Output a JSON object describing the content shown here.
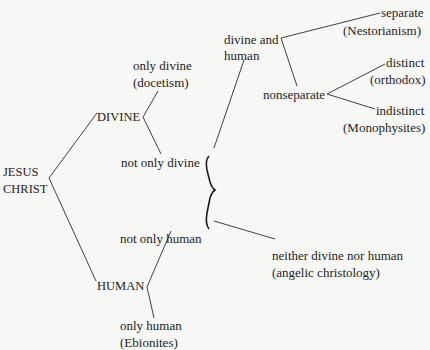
{
  "diagram": {
    "type": "tree",
    "root": {
      "line1": "JESUS",
      "line2": "CHRIST"
    },
    "divine": {
      "label": "DIVINE",
      "only": {
        "line1": "only divine",
        "line2": "(docetism)"
      },
      "not_only": "not only divine"
    },
    "human": {
      "label": "HUMAN",
      "only": {
        "line1": "only human",
        "line2": "(Ebionites)"
      },
      "not_only": "not only human"
    },
    "divine_and_human": {
      "line1": "divine and",
      "line2": "human",
      "separate": {
        "line1": "separate",
        "line2": "(Nestorianism)"
      },
      "nonseparate": {
        "label": "nonseparate",
        "distinct": {
          "line1": "distinct",
          "line2": "(orthodox)"
        },
        "indistinct": {
          "line1": "indistinct",
          "line2": "(Monophysites)"
        }
      }
    },
    "neither": {
      "line1": "neither divine nor human",
      "line2": "(angelic christology)"
    }
  }
}
